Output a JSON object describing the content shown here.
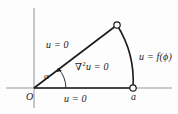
{
  "figure": {
    "background_color": "#fdfdfd",
    "line_color": "#1a1a1a",
    "axis_color": "#7a7a7a",
    "labels": {
      "origin": "O",
      "radius_point": "a",
      "angle": "α",
      "boundary_left": "u = 0",
      "boundary_bottom": "u = 0",
      "boundary_arc": "u = f(ϕ)",
      "interior_equation_nabla": "∇",
      "interior_equation_exponent": "2",
      "interior_equation_rest": "u = 0"
    },
    "geometry": {
      "origin_x": 34,
      "origin_y": 88,
      "radius_point_x": 133,
      "radius_point_y": 88,
      "arc_vertex_x": 117,
      "arc_vertex_y": 25,
      "angle_degrees": 33,
      "vertical_axis_top_y": 8,
      "vertical_axis_bottom_y": 108,
      "horizontal_axis_left_x": 6,
      "horizontal_axis_right_x": 172
    },
    "markers": [
      {
        "name": "arc-top-vertex-marker",
        "x": 117,
        "y": 25,
        "style": "open-circle"
      },
      {
        "name": "radius-point-marker",
        "x": 133,
        "y": 88,
        "style": "open-circle"
      }
    ]
  }
}
